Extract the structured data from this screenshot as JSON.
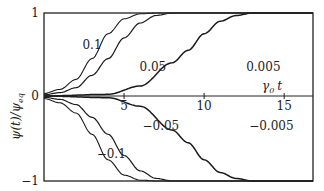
{
  "chart_data": {
    "type": "line",
    "title": "",
    "xlabel": "γ₀ t",
    "ylabel": "ψ(t)/ψ_eq",
    "xlim": [
      0,
      16.8
    ],
    "ylim": [
      -1,
      1
    ],
    "x_ticks": [
      5,
      10,
      15
    ],
    "x_tick_labels": [
      "5",
      "10",
      "15"
    ],
    "y_ticks": [
      -1,
      0,
      1
    ],
    "y_tick_labels": [
      "−1",
      "0",
      "1"
    ],
    "grid": false,
    "legend": "inline labels on curves",
    "series": [
      {
        "name": "0.1",
        "label": "0.1",
        "sign": 1,
        "t_half": 3.2,
        "width": 1.1,
        "points": [
          [
            0,
            0.03
          ],
          [
            1,
            0.08
          ],
          [
            2,
            0.2
          ],
          [
            3,
            0.45
          ],
          [
            4,
            0.75
          ],
          [
            5,
            0.93
          ],
          [
            6,
            0.99
          ],
          [
            7,
            1
          ]
        ]
      },
      {
        "name": "0.05",
        "label": "0.05",
        "sign": 1,
        "t_half": 4.4,
        "width": 1.2,
        "points": [
          [
            0,
            0.015
          ],
          [
            1,
            0.04
          ],
          [
            2,
            0.1
          ],
          [
            3,
            0.25
          ],
          [
            4,
            0.45
          ],
          [
            5,
            0.7
          ],
          [
            6,
            0.88
          ],
          [
            7,
            0.97
          ],
          [
            8,
            1
          ]
        ]
      },
      {
        "name": "0.005",
        "label": "0.005",
        "sign": 1,
        "t_half": 9.0,
        "width": 1.5,
        "points": [
          [
            0,
            0
          ],
          [
            4,
            0.02
          ],
          [
            6,
            0.12
          ],
          [
            8,
            0.4
          ],
          [
            9,
            0.55
          ],
          [
            10,
            0.75
          ],
          [
            11,
            0.9
          ],
          [
            12,
            0.97
          ],
          [
            13,
            1
          ]
        ]
      },
      {
        "name": "-0.1",
        "label": "−0.1",
        "sign": -1,
        "t_half": 3.2,
        "width": 1.1,
        "points": [
          [
            0,
            -0.03
          ],
          [
            1,
            -0.08
          ],
          [
            2,
            -0.2
          ],
          [
            3,
            -0.45
          ],
          [
            4,
            -0.75
          ],
          [
            5,
            -0.93
          ],
          [
            6,
            -0.99
          ],
          [
            7,
            -1
          ]
        ]
      },
      {
        "name": "-0.05",
        "label": "−0.05",
        "sign": -1,
        "t_half": 4.4,
        "width": 1.2,
        "points": [
          [
            0,
            -0.015
          ],
          [
            1,
            -0.04
          ],
          [
            2,
            -0.1
          ],
          [
            3,
            -0.25
          ],
          [
            4,
            -0.45
          ],
          [
            5,
            -0.7
          ],
          [
            6,
            -0.88
          ],
          [
            7,
            -0.97
          ],
          [
            8,
            -1
          ]
        ]
      },
      {
        "name": "-0.005",
        "label": "−0.005",
        "sign": -1,
        "t_half": 9.0,
        "width": 1.5,
        "points": [
          [
            0,
            0
          ],
          [
            4,
            -0.02
          ],
          [
            6,
            -0.12
          ],
          [
            8,
            -0.4
          ],
          [
            9,
            -0.55
          ],
          [
            10,
            -0.75
          ],
          [
            11,
            -0.9
          ],
          [
            12,
            -0.97
          ],
          [
            13,
            -1
          ]
        ]
      }
    ],
    "annotations": [
      {
        "text": "0.1",
        "x": 3.0,
        "y": 0.62
      },
      {
        "text": "0.05",
        "x": 6.8,
        "y": 0.35
      },
      {
        "text": "0.005",
        "x": 13.7,
        "y": 0.35
      },
      {
        "text": "γ₀ t",
        "x": 12.5,
        "y": 0.12
      },
      {
        "text": "−0.1",
        "x": 4.2,
        "y": -0.68
      },
      {
        "text": "−0.05",
        "x": 7.3,
        "y": -0.35
      },
      {
        "text": "−0.005",
        "x": 14.2,
        "y": -0.35
      }
    ]
  },
  "plot": {
    "x_axis_label_main": "γ",
    "x_axis_label_sub": "0",
    "x_axis_label_var": "t",
    "y_axis_label": "ψ(t)/ψ",
    "y_axis_label_sub": "eq",
    "colors": {
      "line": "#1a1a1a",
      "frame": "#222222",
      "background": "#ffffff"
    }
  }
}
